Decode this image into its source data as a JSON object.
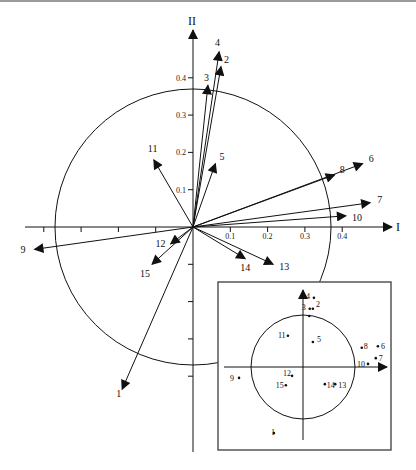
{
  "figure": {
    "axis_labels": {
      "x": "I",
      "y": "II"
    },
    "x_ticks": [
      "0.1",
      "0.2",
      "0.3",
      "0.4"
    ],
    "y_ticks": [
      "0.1",
      "0.2",
      "0.3",
      "0.4"
    ],
    "circle_radius": 0.37,
    "colors": {
      "ink": "#111111",
      "frame": "#555555",
      "background": "#ffffff"
    }
  },
  "chart_data": {
    "type": "scatter",
    "title": "",
    "xlabel": "I",
    "ylabel": "II",
    "xlim": [
      -0.45,
      0.5
    ],
    "ylim": [
      -0.55,
      0.5
    ],
    "vectors": [
      {
        "label": "1",
        "x": -0.19,
        "y": -0.435
      },
      {
        "label": "2",
        "x": 0.075,
        "y": 0.43
      },
      {
        "label": "3",
        "x": 0.04,
        "y": 0.38
      },
      {
        "label": "4",
        "x": 0.07,
        "y": 0.47
      },
      {
        "label": "5",
        "x": 0.06,
        "y": 0.17
      },
      {
        "label": "6",
        "x": 0.455,
        "y": 0.17
      },
      {
        "label": "7",
        "x": 0.475,
        "y": 0.065
      },
      {
        "label": "8",
        "x": 0.38,
        "y": 0.14
      },
      {
        "label": "9",
        "x": -0.425,
        "y": -0.06
      },
      {
        "label": "10",
        "x": 0.41,
        "y": 0.03
      },
      {
        "label": "11",
        "x": -0.105,
        "y": 0.18
      },
      {
        "label": "12",
        "x": -0.06,
        "y": -0.045
      },
      {
        "label": "13",
        "x": 0.215,
        "y": -0.1
      },
      {
        "label": "14",
        "x": 0.14,
        "y": -0.085
      },
      {
        "label": "15",
        "x": -0.11,
        "y": -0.1
      }
    ],
    "inset": {
      "type": "scatter",
      "circle_radius": 1.0,
      "points": [
        {
          "label": "1",
          "x": -0.56,
          "y": -1.27
        },
        {
          "label": "2",
          "x": 0.19,
          "y": 1.12
        },
        {
          "label": "3",
          "x": 0.13,
          "y": 1.12
        },
        {
          "label": "4",
          "x": 0.21,
          "y": 1.33
        },
        {
          "label": "5",
          "x": 0.19,
          "y": 0.48
        },
        {
          "label": "6",
          "x": 1.44,
          "y": 0.4
        },
        {
          "label": "7",
          "x": 1.4,
          "y": 0.17
        },
        {
          "label": "8",
          "x": 1.13,
          "y": 0.37
        },
        {
          "label": "9",
          "x": -1.23,
          "y": -0.21
        },
        {
          "label": "10",
          "x": 1.25,
          "y": 0.06
        },
        {
          "label": "11",
          "x": -0.29,
          "y": 0.6
        },
        {
          "label": "12",
          "x": -0.21,
          "y": -0.17
        },
        {
          "label": "13",
          "x": 0.62,
          "y": -0.33
        },
        {
          "label": "14",
          "x": 0.42,
          "y": -0.33
        },
        {
          "label": "15",
          "x": -0.33,
          "y": -0.35
        },
        {
          "label": "",
          "x": 0.12,
          "y": 0.98
        }
      ]
    }
  }
}
